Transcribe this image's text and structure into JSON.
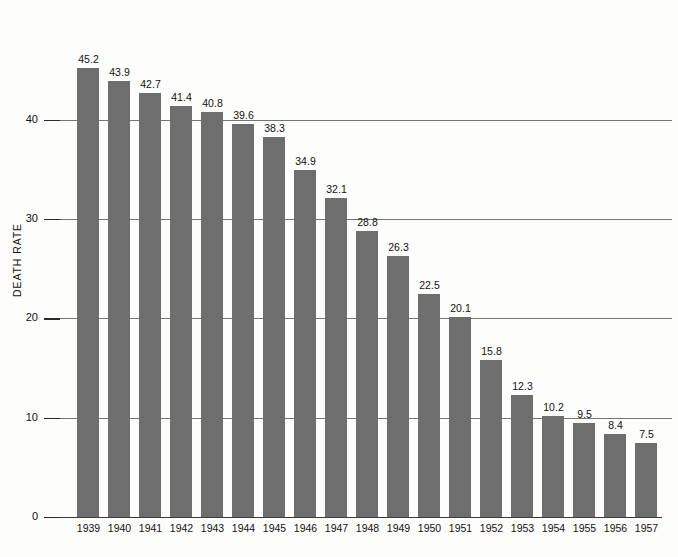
{
  "chart_data": {
    "type": "bar",
    "title": "",
    "subtitle": "",
    "xlabel": "",
    "ylabel": "DEATH RATE",
    "ylim": [
      0,
      50
    ],
    "yticks": [
      0,
      10,
      20,
      30,
      40
    ],
    "ytick_labels": [
      "0",
      "10",
      "20",
      "30",
      "40"
    ],
    "grid": true,
    "legend": false,
    "legend_position": "none",
    "bar_color": "#6e6e6e",
    "background_color": "#fdfdfb",
    "axis_color": "#2b2b2b",
    "categories": [
      "1939",
      "1940",
      "1941",
      "1942",
      "1943",
      "1944",
      "1945",
      "1946",
      "1947",
      "1948",
      "1949",
      "1950",
      "1951",
      "1952",
      "1953",
      "1954",
      "1955",
      "1956",
      "1957"
    ],
    "values": [
      45.2,
      43.9,
      42.7,
      41.4,
      40.8,
      39.6,
      38.3,
      34.9,
      32.1,
      28.8,
      26.3,
      22.5,
      20.1,
      15.8,
      12.3,
      10.2,
      9.5,
      8.4,
      7.5
    ],
    "value_labels": [
      "45.2",
      "43.9",
      "42.7",
      "41.4",
      "40.8",
      "39.6",
      "38.3",
      "34.9",
      "32.1",
      "28.8",
      "26.3",
      "22.5",
      "20.1",
      "15.8",
      "12.3",
      "10.2",
      "9.5",
      "8.4",
      "7.5"
    ]
  },
  "axis": {
    "y_title": "DEATH RATE"
  },
  "caption": {
    "bottom_text": ""
  }
}
